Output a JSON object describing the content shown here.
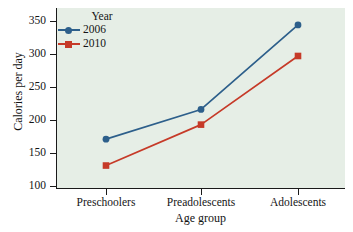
{
  "chart_data": {
    "type": "line",
    "title": "",
    "xlabel": "Age group",
    "ylabel": "Calories per day",
    "categories": [
      "Preschoolers",
      "Preadolescents",
      "Adolescents"
    ],
    "series": [
      {
        "name": "2006",
        "color": "#2d5f8b",
        "marker": "circle",
        "values": [
          171,
          216,
          344
        ]
      },
      {
        "name": "2010",
        "color": "#c63a28",
        "marker": "square",
        "values": [
          131,
          193,
          297
        ]
      }
    ],
    "ylim": [
      100,
      350
    ],
    "yticks": [
      100,
      150,
      200,
      250,
      300,
      350
    ],
    "ytick_labels": [
      "100",
      "150",
      "200",
      "250",
      "300",
      "350"
    ],
    "grid": false,
    "legend": {
      "title": "Year",
      "position": "top-left-inside",
      "entries": [
        "2006",
        "2010"
      ]
    },
    "plot_background": "#e6eee6",
    "figure_background": "#ffffff"
  },
  "axes": {
    "y_label": "Calories per day",
    "x_label": "Age group"
  },
  "legend": {
    "title": "Year",
    "items": [
      {
        "label": "2006"
      },
      {
        "label": "2010"
      }
    ]
  },
  "ticks": {
    "y": [
      "350",
      "300",
      "250",
      "200",
      "150",
      "100"
    ],
    "x": [
      "Preschoolers",
      "Preadolescents",
      "Adolescents"
    ]
  }
}
